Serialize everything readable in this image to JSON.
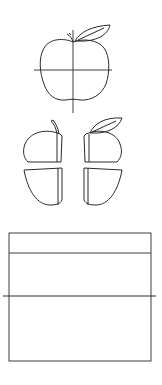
{
  "figure": {
    "apple_whole": {
      "labels": [
        "1/4",
        "1/4",
        "1/4",
        "1/4"
      ],
      "numerator": "1",
      "denominator": "4"
    },
    "apple_pieces": {
      "labels": [
        "1/4",
        "1/4",
        "1/4",
        "1/4"
      ],
      "numerator": "1",
      "denominator": "4"
    },
    "grid": {
      "rows": 2,
      "columns": 5,
      "numerator": "1",
      "denominator": "10",
      "cells": [
        "1/10",
        "1/10",
        "1/10",
        "1/10",
        "1/10",
        "1/10",
        "1/10",
        "1/10",
        "1/10",
        "1/10"
      ],
      "circle_markers": 3
    },
    "ink_color": "#2a2a2a"
  }
}
